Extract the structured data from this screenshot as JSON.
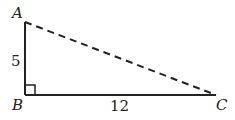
{
  "diagram": {
    "type": "right-triangle",
    "vertices": {
      "A": {
        "label": "A"
      },
      "B": {
        "label": "B"
      },
      "C": {
        "label": "C"
      }
    },
    "sides": {
      "AB": {
        "label": "5",
        "style": "solid"
      },
      "BC": {
        "label": "12",
        "style": "solid"
      },
      "AC": {
        "label": "",
        "style": "dashed"
      }
    },
    "right_angle_at": "B",
    "colors": {
      "stroke": "#222222",
      "background": "#ffffff"
    }
  }
}
